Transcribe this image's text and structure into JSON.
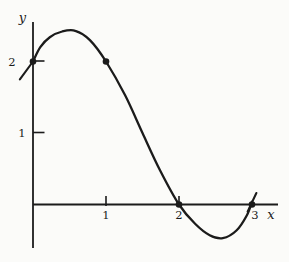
{
  "chart_data": {
    "type": "line",
    "title": "",
    "xlabel": "x",
    "ylabel": "y",
    "grid": false,
    "legend": false,
    "xlim": [
      -0.2,
      3.4
    ],
    "ylim": [
      -0.8,
      2.55
    ],
    "x_tick_values": [
      1,
      2,
      3
    ],
    "x_tick_labels": [
      "1",
      "2",
      "3"
    ],
    "x_ticks_with_mark": [
      1,
      2
    ],
    "y_tick_values": [
      1,
      2
    ],
    "y_tick_labels": [
      "1",
      "2"
    ],
    "curve_points": [
      [
        0.0,
        2.0
      ],
      [
        0.1,
        2.2
      ],
      [
        0.23,
        2.34
      ],
      [
        0.4,
        2.42
      ],
      [
        0.58,
        2.43
      ],
      [
        0.78,
        2.3
      ],
      [
        1.0,
        2.0
      ],
      [
        1.26,
        1.53
      ],
      [
        1.5,
        1.0
      ],
      [
        1.74,
        0.48
      ],
      [
        2.0,
        0.0
      ],
      [
        2.22,
        -0.27
      ],
      [
        2.42,
        -0.43
      ],
      [
        2.6,
        -0.47
      ],
      [
        2.79,
        -0.36
      ],
      [
        2.93,
        -0.15
      ],
      [
        3.0,
        0.04
      ]
    ],
    "marked_points": [
      [
        0,
        2
      ],
      [
        1,
        2
      ],
      [
        2,
        0
      ],
      [
        3,
        0
      ]
    ],
    "tangent_segments": [
      {
        "from": [
          -0.18,
          1.75
        ],
        "to": [
          0.0,
          2.0
        ]
      },
      {
        "from": [
          2.94,
          -0.1
        ],
        "to": [
          3.06,
          0.16
        ]
      }
    ],
    "ink_color": "#1b1b1b",
    "paper_color": "#fbfbf9"
  }
}
